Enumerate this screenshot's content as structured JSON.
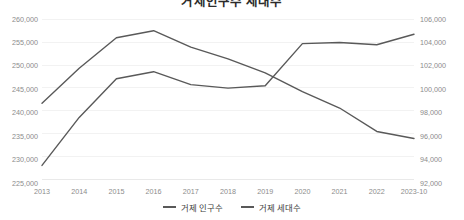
{
  "chart_data": {
    "type": "line",
    "title": "거제인구수 세대수",
    "xlabel": "",
    "ylabel": "",
    "grid": true,
    "legend_position": "bottom",
    "categories": [
      "2013",
      "2014",
      "2015",
      "2016",
      "2017",
      "2018",
      "2019",
      "2020",
      "2021",
      "2022",
      "2023-10"
    ],
    "axes": {
      "left": {
        "label": "거제 인구수",
        "ylim": [
          225000,
          260000
        ],
        "ticks": [
          "225,000",
          "230,000",
          "235,000",
          "240,000",
          "245,000",
          "250,000",
          "255,000",
          "260,000"
        ],
        "tick_values": [
          225000,
          230000,
          235000,
          240000,
          245000,
          250000,
          255000,
          260000
        ]
      },
      "right": {
        "label": "거제 세대수",
        "ylim": [
          92000,
          106000
        ],
        "ticks": [
          "92,000",
          "94,000",
          "96,000",
          "98,000",
          "100,000",
          "102,000",
          "104,000",
          "106,000"
        ],
        "tick_values": [
          92000,
          94000,
          96000,
          98000,
          100000,
          102000,
          104000,
          106000
        ]
      }
    },
    "series": [
      {
        "name": "거제 인구수",
        "axis": "left",
        "color": "#595959",
        "values": [
          242000,
          249500,
          256000,
          257500,
          254000,
          251500,
          248500,
          244500,
          241000,
          236000,
          234500
        ]
      },
      {
        "name": "거제 세대수",
        "axis": "right",
        "color": "#595959",
        "values": [
          93500,
          97600,
          100900,
          101500,
          100400,
          100100,
          100300,
          103900,
          104000,
          103800,
          104700
        ]
      }
    ]
  },
  "legend": {
    "items": [
      {
        "label": "거제 인구수"
      },
      {
        "label": "거제 세대수"
      }
    ]
  }
}
